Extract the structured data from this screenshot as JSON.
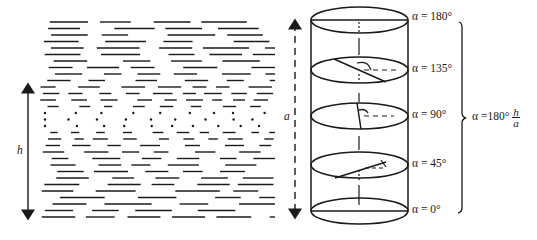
{
  "figure": {
    "left_panel": {
      "description": "Cholesteric layers shown as horizontal dashes; dotted row indicates molecules viewed end-on",
      "dimension_label": "h"
    },
    "pitch_arrow": {
      "label": "a",
      "style": "dashed double-headed"
    },
    "cylinder": {
      "layers": [
        {
          "angle_label": "α = 180°",
          "y": 20,
          "angle_deg": 180
        },
        {
          "angle_label": "α = 135°",
          "y": 70,
          "angle_deg": 135
        },
        {
          "angle_label": "α = 90°",
          "y": 116,
          "angle_deg": 90
        },
        {
          "angle_label": "α = 45°",
          "y": 165,
          "angle_deg": 45
        },
        {
          "angle_label": "α = 0°",
          "y": 211,
          "angle_deg": 0
        }
      ]
    },
    "formula": {
      "lhs": "α =180°",
      "numerator": "h",
      "denominator": "a"
    },
    "colors": {
      "ink": "#1a1a1a",
      "background": "#ffffff"
    }
  }
}
